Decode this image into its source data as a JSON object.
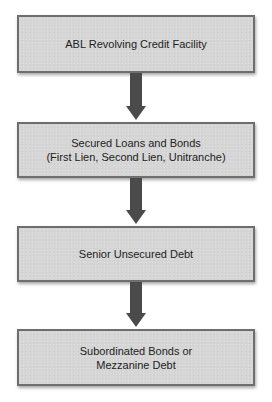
{
  "diagram": {
    "type": "flowchart",
    "direction": "top-to-bottom",
    "colors": {
      "box_fill": "#d6d6d6",
      "box_border": "#6e6e6e",
      "arrow": "#4a4a4a",
      "text": "#222222"
    },
    "nodes": [
      {
        "id": "n1",
        "lines": [
          "ABL Revolving Credit Facility"
        ]
      },
      {
        "id": "n2",
        "lines": [
          "Secured Loans and Bonds",
          "(First Lien, Second Lien, Unitranche)"
        ]
      },
      {
        "id": "n3",
        "lines": [
          "Senior Unsecured Debt"
        ]
      },
      {
        "id": "n4",
        "lines": [
          "Subordinated Bonds or",
          "Mezzanine Debt"
        ]
      }
    ],
    "edges": [
      {
        "from": "n1",
        "to": "n2",
        "icon": "arrow-down-icon"
      },
      {
        "from": "n2",
        "to": "n3",
        "icon": "arrow-down-icon"
      },
      {
        "from": "n3",
        "to": "n4",
        "icon": "arrow-down-icon"
      }
    ]
  }
}
